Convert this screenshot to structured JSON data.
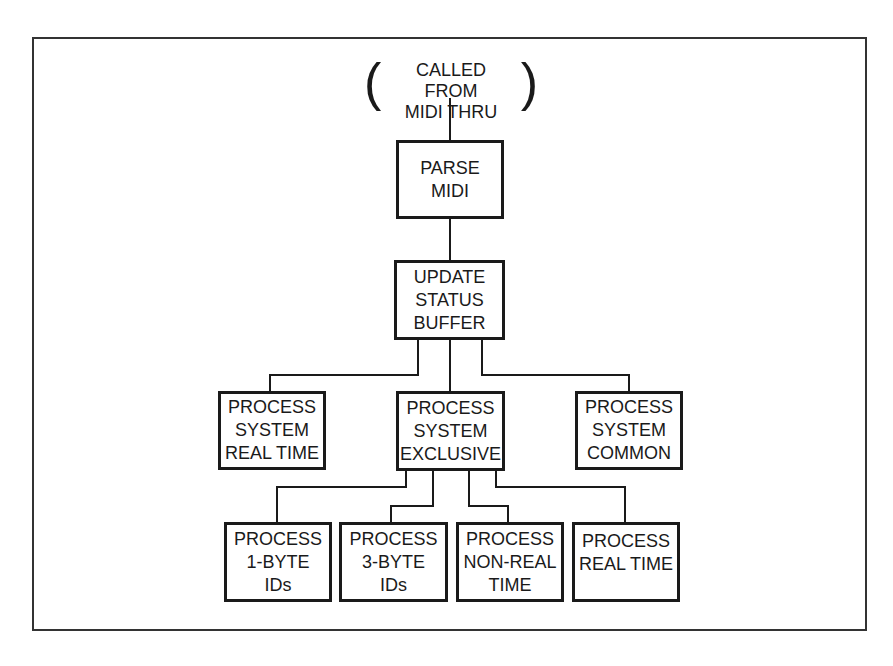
{
  "diagram": {
    "type": "hierarchy-flowchart",
    "line_color": "#1a1a1a",
    "frame_color": "#333333",
    "origin": {
      "open_paren": "(",
      "close_paren": ")",
      "lines": [
        "CALLED FROM",
        "MIDI THRU"
      ]
    },
    "nodes": {
      "parse_midi": {
        "lines": [
          "PARSE",
          "MIDI"
        ]
      },
      "update_status_buffer": {
        "lines": [
          "UPDATE",
          "STATUS",
          "BUFFER"
        ]
      },
      "process_system_real_time": {
        "lines": [
          "PROCESS",
          "SYSTEM",
          "REAL TIME"
        ]
      },
      "process_system_exclusive": {
        "lines": [
          "PROCESS",
          "SYSTEM",
          "EXCLUSIVE"
        ]
      },
      "process_system_common": {
        "lines": [
          "PROCESS",
          "SYSTEM",
          "COMMON"
        ]
      },
      "process_1byte_ids": {
        "lines": [
          "PROCESS",
          "1-BYTE",
          "IDs"
        ]
      },
      "process_3byte_ids": {
        "lines": [
          "PROCESS",
          "3-BYTE",
          "IDs"
        ]
      },
      "process_non_real_time": {
        "lines": [
          "PROCESS",
          "NON-REAL",
          "TIME"
        ]
      },
      "process_real_time": {
        "lines": [
          "PROCESS",
          "REAL TIME"
        ]
      }
    },
    "edges": [
      [
        "origin",
        "parse_midi"
      ],
      [
        "parse_midi",
        "update_status_buffer"
      ],
      [
        "update_status_buffer",
        "process_system_real_time"
      ],
      [
        "update_status_buffer",
        "process_system_exclusive"
      ],
      [
        "update_status_buffer",
        "process_system_common"
      ],
      [
        "process_system_exclusive",
        "process_1byte_ids"
      ],
      [
        "process_system_exclusive",
        "process_3byte_ids"
      ],
      [
        "process_system_exclusive",
        "process_non_real_time"
      ],
      [
        "process_system_exclusive",
        "process_real_time"
      ]
    ]
  }
}
